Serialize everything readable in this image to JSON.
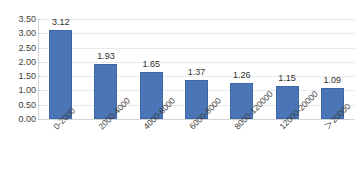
{
  "chart_data": {
    "type": "bar",
    "title": "",
    "subtitle": "",
    "xlabel": "",
    "ylabel": "",
    "ylim": [
      0,
      3.5
    ],
    "ytick_step": 0.5,
    "grid": true,
    "legend": false,
    "legend_position": "none",
    "bar_color": "#4a76b8",
    "bar_border_color": "#3d66a3",
    "gridline_color": "#e9eaec",
    "axis_color": "#d2d4d7",
    "text_color": "#3d3d3d",
    "background": "#ffffff",
    "categories": [
      "0-2000",
      "2000-4000",
      "4000-6000",
      "6000-8000",
      "8000-120000",
      "12000-20000",
      "＞20000"
    ],
    "values": [
      3.12,
      1.93,
      1.65,
      1.37,
      1.26,
      1.15,
      1.09
    ],
    "value_labels": [
      "3.12",
      "1.93",
      "1.65",
      "1.37",
      "1.26",
      "1.15",
      "1.09"
    ],
    "ytick_labels": [
      "0.00",
      "0.50",
      "1.00",
      "1.50",
      "2.00",
      "2.50",
      "3.00",
      "3.50"
    ],
    "ytick_values": [
      0,
      0.5,
      1,
      1.5,
      2,
      2.5,
      3,
      3.5
    ]
  }
}
